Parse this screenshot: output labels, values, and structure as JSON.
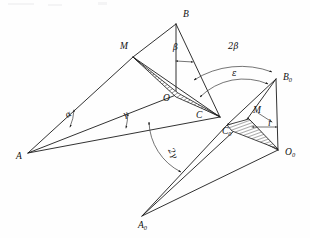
{
  "figure": {
    "kind": "geometry-diagram",
    "caption": "",
    "background_color": "#fefefe",
    "line_color": "#1b1b1b"
  },
  "vertices": [
    {
      "key": "A",
      "label": "A",
      "sub": "",
      "x": 28,
      "y": 153,
      "label_x": 16,
      "label_y": 159
    },
    {
      "key": "B",
      "label": "B",
      "sub": "",
      "x": 176,
      "y": 24,
      "label_x": 183,
      "label_y": 17
    },
    {
      "key": "C",
      "label": "C",
      "sub": "",
      "x": 220,
      "y": 117,
      "label_x": 196,
      "label_y": 118
    },
    {
      "key": "M",
      "label": "M",
      "sub": "",
      "x": 133,
      "y": 57,
      "label_x": 120,
      "label_y": 49
    },
    {
      "key": "O",
      "label": "O",
      "sub": "",
      "x": 176,
      "y": 95,
      "label_x": 163,
      "label_y": 101
    },
    {
      "key": "A0",
      "label": "A",
      "sub": "0",
      "x": 142,
      "y": 216,
      "label_x": 138,
      "label_y": 228
    },
    {
      "key": "B0",
      "label": "B",
      "sub": "0",
      "x": 276,
      "y": 79,
      "label_x": 283,
      "label_y": 80
    },
    {
      "key": "C0",
      "label": "C",
      "sub": "0",
      "x": 228,
      "y": 124,
      "label_x": 222,
      "label_y": 134
    },
    {
      "key": "O0",
      "label": "O",
      "sub": "0",
      "x": 278,
      "y": 150,
      "label_x": 285,
      "label_y": 155
    },
    {
      "key": "M0",
      "label": "M",
      "sub": "",
      "x": 248,
      "y": 118,
      "label_x": 253,
      "label_y": 113
    }
  ],
  "angle_labels": [
    {
      "key": "alpha",
      "text": "α",
      "x": 67,
      "y": 118,
      "rotate": -28
    },
    {
      "key": "gamma",
      "text": "γ",
      "x": 124,
      "y": 118,
      "rotate": -22
    },
    {
      "key": "beta",
      "text": "β",
      "x": 173,
      "y": 50,
      "rotate": 0
    },
    {
      "key": "twobeta",
      "text": "2β",
      "x": 228,
      "y": 49,
      "rotate": 0
    },
    {
      "key": "epsilon",
      "text": "ε",
      "x": 232,
      "y": 76,
      "rotate": 0
    },
    {
      "key": "twogamma",
      "text": "2γ",
      "x": 168,
      "y": 150,
      "rotate": 62
    },
    {
      "key": "i",
      "text": "i",
      "x": 268,
      "y": 126,
      "rotate": 0
    }
  ],
  "segments": [
    {
      "name": "A-M",
      "from": "A",
      "to": "M"
    },
    {
      "name": "M-B",
      "from": "M",
      "to": "B"
    },
    {
      "name": "B-C",
      "from": "B",
      "to": "C"
    },
    {
      "name": "B-O",
      "from": "B",
      "to": "O"
    },
    {
      "name": "A-O",
      "from": "A",
      "to": "O"
    },
    {
      "name": "A-C",
      "from": "A",
      "to": "C"
    },
    {
      "name": "M-C",
      "from": "M",
      "to": "C"
    },
    {
      "name": "O-C",
      "from": "O",
      "to": "C"
    },
    {
      "name": "A0-C0",
      "from": "A0",
      "to": "C0"
    },
    {
      "name": "A0-O0",
      "from": "A0",
      "to": "O0"
    },
    {
      "name": "A0-M0",
      "from": "A0",
      "to": "M0"
    },
    {
      "name": "C0-B0",
      "from": "C0",
      "to": "B0"
    },
    {
      "name": "C0-O0",
      "from": "C0",
      "to": "O0"
    },
    {
      "name": "B0-O0",
      "from": "B0",
      "to": "O0"
    },
    {
      "name": "M0-B0",
      "from": "M0",
      "to": "B0"
    },
    {
      "name": "M0-O0",
      "from": "M0",
      "to": "O0"
    }
  ],
  "hatched_regions": [
    {
      "name": "sliver-M-O-C",
      "note": "thin hatched sliver from M through O toward C"
    },
    {
      "name": "sliver-C0-M0-O0",
      "note": "thin hatched sliver from C0 toward O0"
    }
  ],
  "arcs": [
    {
      "name": "arc-2beta",
      "label_key": "twobeta",
      "note": "outer arc from B-C direction to B0"
    },
    {
      "name": "arc-epsilon",
      "label_key": "epsilon",
      "note": "inner arc from C toward B0"
    },
    {
      "name": "arc-2gamma",
      "label_key": "twogamma",
      "note": "arc between A-C line and A0-C0 line"
    }
  ]
}
